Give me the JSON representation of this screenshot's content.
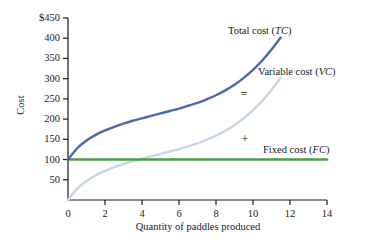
{
  "chart_data": {
    "type": "line",
    "title": "",
    "xlabel": "Quantity of paddles produced",
    "ylabel": "Cost",
    "xlim": [
      0,
      14
    ],
    "ylim": [
      0,
      450
    ],
    "grid": false,
    "legend_position": "inline-right",
    "x_ticks": [
      "0",
      "2",
      "4",
      "6",
      "8",
      "10",
      "12",
      "14"
    ],
    "x_tick_values": [
      0,
      2,
      4,
      6,
      8,
      10,
      12,
      14
    ],
    "y_ticks": [
      "50",
      "100",
      "150",
      "200",
      "250",
      "300",
      "350",
      "400",
      "$450"
    ],
    "y_tick_values": [
      50,
      100,
      150,
      200,
      250,
      300,
      350,
      400,
      450
    ],
    "series": [
      {
        "name": "Total cost (TC)",
        "label_text": "Total cost (",
        "label_abbr": "TC",
        "label_close": ")",
        "color": "#4a69b0",
        "x": [
          0,
          0.5,
          1,
          1.5,
          2,
          2.5,
          3,
          3.5,
          4,
          4.5,
          5,
          5.5,
          6,
          6.5,
          7,
          7.5,
          8,
          8.5,
          9,
          9.5,
          10,
          10.5,
          11,
          11.5
        ],
        "values": [
          100,
          128,
          147,
          161,
          172,
          181,
          189,
          196,
          202,
          208,
          214,
          220,
          226,
          233,
          240,
          249,
          259,
          271,
          285,
          302,
          322,
          345,
          372,
          402
        ]
      },
      {
        "name": "Variable cost (VC)",
        "label_text": "Variable cost (",
        "label_abbr": "VC",
        "label_close": ")",
        "color": "#c8d6ea",
        "x": [
          0,
          0.5,
          1,
          1.5,
          2,
          2.5,
          3,
          3.5,
          4,
          4.5,
          5,
          5.5,
          6,
          6.5,
          7,
          7.5,
          8,
          8.5,
          9,
          9.5,
          10,
          10.5,
          11,
          11.5
        ],
        "values": [
          0,
          28,
          47,
          61,
          72,
          81,
          89,
          96,
          102,
          108,
          114,
          120,
          126,
          133,
          140,
          149,
          159,
          171,
          185,
          202,
          222,
          245,
          272,
          302
        ]
      },
      {
        "name": "Fixed cost (FC)",
        "label_text": "Fixed cost (",
        "label_abbr": "FC",
        "label_close": ")",
        "color": "#4a9e48",
        "x": [
          0,
          14
        ],
        "values": [
          100,
          100
        ]
      }
    ],
    "annotations": [
      {
        "text": "=",
        "x": 9.5,
        "y": 340
      },
      {
        "text": "+",
        "x": 9.55,
        "y": 155
      }
    ]
  },
  "labels": {
    "total_cost_prefix": "Total cost (",
    "total_cost_abbr": "TC",
    "total_cost_suffix": ")",
    "variable_cost_prefix": "Variable cost (",
    "variable_cost_abbr": "VC",
    "variable_cost_suffix": ")",
    "fixed_cost_prefix": "Fixed cost (",
    "fixed_cost_abbr": "FC",
    "fixed_cost_suffix": ")",
    "equals_operator": "=",
    "plus_operator": "+"
  },
  "colors": {
    "total_cost": "#4a69b0",
    "variable_cost": "#c8d6ea",
    "fixed_cost": "#4a9e48",
    "axis": "#1a1a1a",
    "background": "#ffffff"
  }
}
